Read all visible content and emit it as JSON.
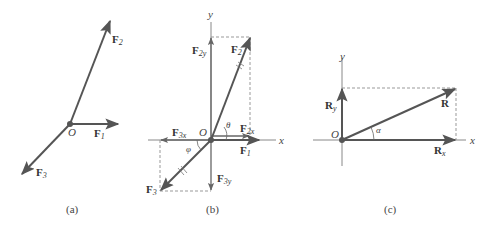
{
  "figure": {
    "panels": [
      {
        "id": "a",
        "caption": "(a)",
        "origin_label": "O",
        "vectors": [
          {
            "name": "F",
            "sub": "1"
          },
          {
            "name": "F",
            "sub": "2"
          },
          {
            "name": "F",
            "sub": "3"
          }
        ]
      },
      {
        "id": "b",
        "caption": "(b)",
        "origin_label": "O",
        "axis_x": "x",
        "axis_y": "y",
        "vectors": [
          {
            "name": "F",
            "sub": "1"
          },
          {
            "name": "F",
            "sub": "2"
          },
          {
            "name": "F",
            "sub": "3"
          },
          {
            "name": "F",
            "sub": "2y"
          },
          {
            "name": "F",
            "sub": "2x"
          },
          {
            "name": "F",
            "sub": "3x"
          },
          {
            "name": "F",
            "sub": "3y"
          }
        ],
        "angles": [
          "θ",
          "φ"
        ]
      },
      {
        "id": "c",
        "caption": "(c)",
        "origin_label": "O",
        "axis_x": "x",
        "axis_y": "y",
        "vectors": [
          {
            "name": "R",
            "sub": ""
          },
          {
            "name": "R",
            "sub": "x"
          },
          {
            "name": "R",
            "sub": "y"
          }
        ],
        "angles": [
          "α"
        ]
      }
    ],
    "colors": {
      "vector": "#555555",
      "axis": "#888888",
      "dashed": "#999999",
      "text": "#333333"
    }
  }
}
